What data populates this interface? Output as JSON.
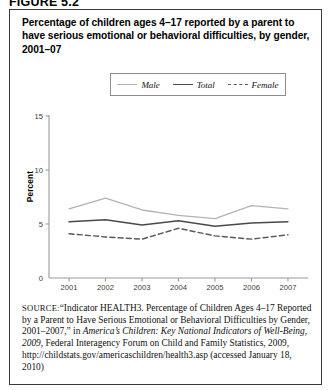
{
  "figure": {
    "number_label": "FIGURE 5.2",
    "title": "Percentage of children ages 4–17 reported by a parent to have serious emotional or behavioral difficulties, by gender, 2001–07"
  },
  "legend": {
    "items": [
      {
        "label": "Male",
        "style": "solid-light",
        "color": "#b3b3b3"
      },
      {
        "label": "Total",
        "style": "solid-dark",
        "color": "#4a4a4a"
      },
      {
        "label": "Female",
        "style": "dashed",
        "color": "#5a5a5a"
      }
    ]
  },
  "axes": {
    "ylabel": "Percent",
    "yticks": [
      "0",
      "5",
      "10",
      "15"
    ],
    "xticks": [
      "2001",
      "2002",
      "2003",
      "2004",
      "2005",
      "2006",
      "2007"
    ]
  },
  "source": {
    "prefix": "SOURCE:",
    "text_1": "“Indicator HEALTH3. Percentage of Children Ages 4–17 Reported by a Parent to Have Serious Emotional or Behavioral Difficulties by Gender, 2001–2007,” in ",
    "italic_1": "America’s Children: Key National Indicators of Well-Being, 2009",
    "text_2": ", Federal Interagency Forum on Child and Family Statistics, 2009, http://childstats.gov/americaschildren/health3.asp (accessed January 18, 2010)"
  },
  "chart_data": {
    "type": "line",
    "title": "Percentage of children ages 4–17 reported by a parent to have serious emotional or behavioral difficulties, by gender, 2001–07",
    "xlabel": "",
    "ylabel": "Percent",
    "x": [
      2001,
      2002,
      2003,
      2004,
      2005,
      2006,
      2007
    ],
    "categories": [
      "2001",
      "2002",
      "2003",
      "2004",
      "2005",
      "2006",
      "2007"
    ],
    "ylim": [
      0,
      15
    ],
    "yticks": [
      0,
      5,
      10,
      15
    ],
    "grid": false,
    "legend_position": "top-center",
    "series": [
      {
        "name": "Male",
        "color": "#b3b3b3",
        "dash": "solid",
        "values": [
          6.4,
          7.4,
          6.3,
          5.8,
          5.5,
          6.7,
          6.4
        ]
      },
      {
        "name": "Total",
        "color": "#4a4a4a",
        "dash": "solid",
        "values": [
          5.2,
          5.4,
          4.9,
          5.3,
          4.8,
          5.1,
          5.2
        ]
      },
      {
        "name": "Female",
        "color": "#5a5a5a",
        "dash": "dashed",
        "values": [
          4.1,
          3.8,
          3.6,
          4.6,
          3.9,
          3.6,
          4.0
        ]
      }
    ]
  }
}
